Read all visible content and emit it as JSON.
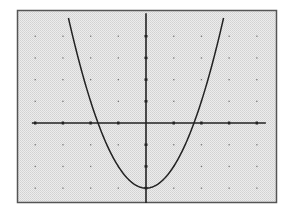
{
  "chart_data": {
    "type": "line",
    "title": "",
    "xlabel": "",
    "ylabel": "",
    "function": "y = x^2 - 3",
    "series": [
      {
        "name": "parabola",
        "x": [
          -2.8,
          -2.5,
          -2,
          -1.732,
          -1.5,
          -1,
          -0.5,
          0,
          0.5,
          1,
          1.5,
          1.732,
          2,
          2.5,
          2.8
        ],
        "values": [
          4.84,
          3.25,
          1,
          0,
          -0.75,
          -2,
          -2.75,
          -3,
          -2.75,
          -2,
          -0.75,
          0,
          1,
          3.25,
          4.84
        ]
      }
    ],
    "xlim": [
      -4.3,
      4.4
    ],
    "ylim": [
      -3.6,
      5.1
    ],
    "x_ticks": [
      -4,
      -3,
      -2,
      -1,
      1,
      2,
      3,
      4
    ],
    "y_ticks": [
      -3,
      -2,
      -1,
      1,
      2,
      3,
      4
    ],
    "grid": "dots",
    "tick_labels_visible": false,
    "legend": "none",
    "vertex": [
      0,
      -3
    ],
    "x_intercepts": [
      -1.732,
      1.732
    ]
  },
  "style": {
    "frame_color": "#555555",
    "background_color": "#e4e4e4",
    "axis_color": "#222222",
    "curve_color": "#222222",
    "grid_dot_color": "#777777"
  }
}
